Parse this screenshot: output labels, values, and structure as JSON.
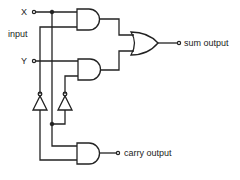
{
  "diagram": {
    "labels": {
      "x": "X",
      "y": "Y",
      "input": "input",
      "sum": "sum output",
      "carry": "carry output"
    },
    "components": [
      {
        "id": "and1",
        "type": "AND",
        "inputs": [
          "X",
          "NOT Y"
        ],
        "output": "to OR"
      },
      {
        "id": "and2",
        "type": "AND",
        "inputs": [
          "Y",
          "NOT X"
        ],
        "output": "to OR"
      },
      {
        "id": "or1",
        "type": "OR",
        "inputs": [
          "and1",
          "and2"
        ],
        "output": "sum output"
      },
      {
        "id": "not1",
        "type": "NOT",
        "input": "Y",
        "output": "and1"
      },
      {
        "id": "not2",
        "type": "NOT",
        "input": "X",
        "output": "and2"
      },
      {
        "id": "and3",
        "type": "AND",
        "inputs": [
          "X",
          "Y"
        ],
        "output": "carry output"
      }
    ],
    "colors": {
      "line": "#222222",
      "background": "#ffffff"
    }
  }
}
